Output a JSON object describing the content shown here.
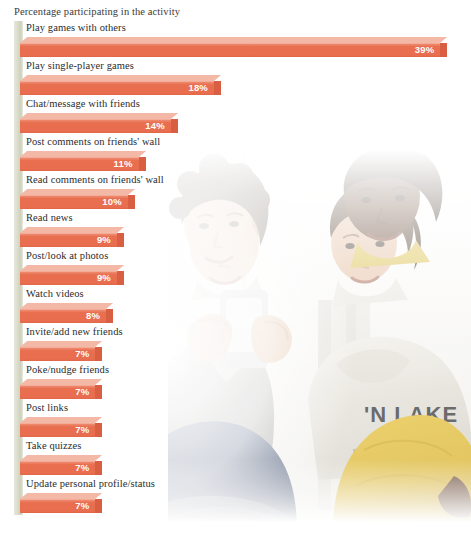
{
  "chart_data": {
    "type": "bar",
    "orientation": "horizontal",
    "title": "Percentage participating in the activity",
    "xlabel": "",
    "ylabel": "",
    "xlim": [
      0,
      40
    ],
    "grid": false,
    "legend": null,
    "value_suffix": "%",
    "categories": [
      "Play games with others",
      "Play single-player games",
      "Chat/message with friends",
      "Post comments on friends' wall",
      "Read comments on friends' wall",
      "Read news",
      "Post/look at photos",
      "Watch videos",
      "Invite/add new friends",
      "Poke/nudge friends",
      "Post links",
      "Take quizzes",
      "Update personal profile/status"
    ],
    "values": [
      39,
      18,
      14,
      11,
      10,
      9,
      9,
      8,
      7,
      7,
      7,
      7,
      7
    ],
    "value_labels": [
      "39%",
      "18%",
      "14%",
      "11%",
      "10%",
      "9%",
      "9%",
      "8%",
      "7%",
      "7%",
      "7%",
      "7%",
      "7%"
    ]
  },
  "style": {
    "bar_front_color": "#e8704f",
    "bar_top_color": "#f3b9a6",
    "bar_side_color": "#d95f42",
    "rail_color": "#d9dbc9",
    "value_text_color": "#ffffff",
    "label_text_color": "#2b2b2b",
    "background_color": "#ffffff"
  },
  "photo": {
    "description": "Four young men gathered around a mobile phone, faded to white at the edges"
  }
}
